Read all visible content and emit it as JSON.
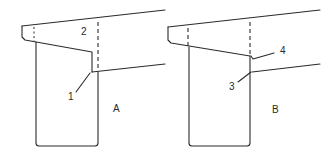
{
  "diagram": {
    "panels": [
      {
        "id": "A",
        "label": "A",
        "callouts": [
          {
            "number": "2",
            "target": "beam-overhang"
          },
          {
            "number": "1",
            "target": "step-corner"
          }
        ]
      },
      {
        "id": "B",
        "label": "B",
        "callouts": [
          {
            "number": "4",
            "target": "notch"
          },
          {
            "number": "3",
            "target": "lower-corner"
          }
        ]
      }
    ],
    "line_color": "#2a2a2a",
    "background": "#ffffff"
  }
}
